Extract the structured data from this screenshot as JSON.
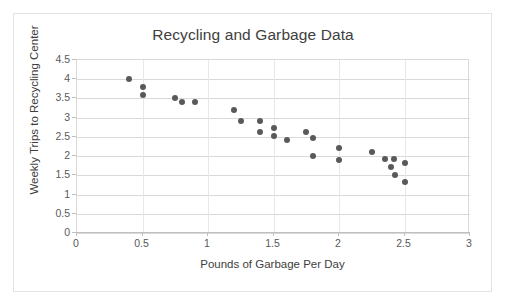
{
  "chart_data": {
    "type": "scatter",
    "title": "Recycling and Garbage Data",
    "xlabel": "Pounds of Garbage Per Day",
    "ylabel": "Weekly Trips to Recycling Center",
    "xlim": [
      0,
      3
    ],
    "ylim": [
      0,
      4.5
    ],
    "xticks": [
      "0",
      "0.5",
      "1",
      "1.5",
      "2",
      "2.5",
      "3"
    ],
    "xtick_values": [
      0,
      0.5,
      1,
      1.5,
      2,
      2.5,
      3
    ],
    "yticks": [
      "0",
      "0.5",
      "1",
      "1.5",
      "2",
      "2.5",
      "3",
      "3.5",
      "4",
      "4.5"
    ],
    "ytick_values": [
      0,
      0.5,
      1,
      1.5,
      2,
      2.5,
      3,
      3.5,
      4,
      4.5
    ],
    "grid": true,
    "legend": false,
    "marker_color": "#595959",
    "series": [
      {
        "name": "Recycling trips vs garbage",
        "points": [
          {
            "x": 0.4,
            "y": 4.0
          },
          {
            "x": 0.5,
            "y": 3.8
          },
          {
            "x": 0.5,
            "y": 3.6
          },
          {
            "x": 0.75,
            "y": 3.5
          },
          {
            "x": 0.8,
            "y": 3.42
          },
          {
            "x": 0.9,
            "y": 3.42
          },
          {
            "x": 1.2,
            "y": 3.2
          },
          {
            "x": 1.25,
            "y": 2.92
          },
          {
            "x": 1.4,
            "y": 2.92
          },
          {
            "x": 1.4,
            "y": 2.62
          },
          {
            "x": 1.5,
            "y": 2.73
          },
          {
            "x": 1.5,
            "y": 2.52
          },
          {
            "x": 1.6,
            "y": 2.42
          },
          {
            "x": 1.75,
            "y": 2.62
          },
          {
            "x": 1.8,
            "y": 2.47
          },
          {
            "x": 1.8,
            "y": 2.0
          },
          {
            "x": 2.0,
            "y": 2.2
          },
          {
            "x": 2.0,
            "y": 1.9
          },
          {
            "x": 2.25,
            "y": 2.1
          },
          {
            "x": 2.35,
            "y": 1.92
          },
          {
            "x": 2.42,
            "y": 1.93
          },
          {
            "x": 2.5,
            "y": 1.82
          },
          {
            "x": 2.4,
            "y": 1.72
          },
          {
            "x": 2.43,
            "y": 1.5
          },
          {
            "x": 2.5,
            "y": 1.32
          }
        ]
      }
    ]
  }
}
